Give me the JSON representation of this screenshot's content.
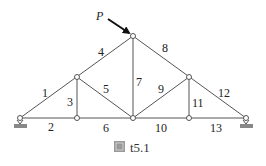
{
  "diagram": {
    "caption": "t5.1",
    "caption_icon": "figure-glyph",
    "load_label": "P",
    "members": [
      {
        "id": "1",
        "x": 46,
        "y": 103
      },
      {
        "id": "2",
        "x": 50,
        "y": 136
      },
      {
        "id": "3",
        "x": 70,
        "y": 106
      },
      {
        "id": "4",
        "x": 100,
        "y": 56
      },
      {
        "id": "5",
        "x": 106,
        "y": 94
      },
      {
        "id": "6",
        "x": 105,
        "y": 136
      },
      {
        "id": "7",
        "x": 139,
        "y": 86
      },
      {
        "id": "8",
        "x": 163,
        "y": 56
      },
      {
        "id": "9",
        "x": 160,
        "y": 94
      },
      {
        "id": "10",
        "x": 160,
        "y": 136
      },
      {
        "id": "11",
        "x": 197,
        "y": 106
      },
      {
        "id": "12",
        "x": 223,
        "y": 103
      },
      {
        "id": "13",
        "x": 216,
        "y": 136
      }
    ]
  }
}
